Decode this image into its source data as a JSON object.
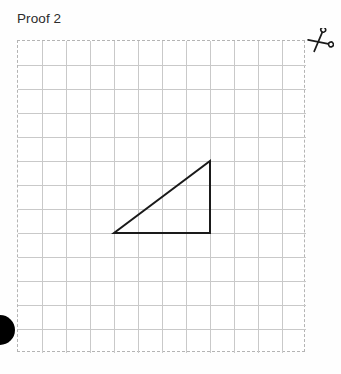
{
  "page": {
    "title": "Proof 2",
    "background_color": "#fefefe"
  },
  "cut_marker": {
    "icon": "scissors-icon",
    "label": "Proof 2",
    "color": "#1a1a1a"
  },
  "grid": {
    "columns": 12,
    "rows": 13,
    "cell_size_px": 24,
    "width_px": 288,
    "height_px": 312,
    "border_style": "dashed",
    "border_color": "#b4b4b4",
    "line_color": "#c9c9c9",
    "background_color": "#ffffff"
  },
  "figure": {
    "name": "right-triangle",
    "stroke_color": "#1a1a1a",
    "stroke_width_px": 2,
    "fill": "none",
    "vertices_cells": [
      {
        "label": "bottom-left",
        "col": 4,
        "row": 8
      },
      {
        "label": "bottom-right",
        "col": 8,
        "row": 8
      },
      {
        "label": "top-right",
        "col": 8,
        "row": 5
      }
    ],
    "base_cells": 4,
    "height_cells": 3
  },
  "edge_dot": {
    "name": "edge-dot",
    "color": "#000000",
    "diameter_px": 30
  }
}
